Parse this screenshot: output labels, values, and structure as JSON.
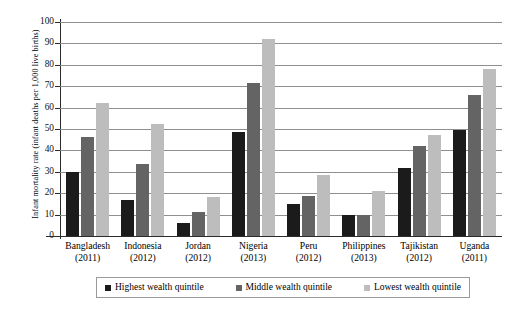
{
  "chart_data": {
    "type": "bar",
    "title": "",
    "subtitle": "",
    "xlabel": "",
    "ylabel": "Infant mortality rate (infant deaths per 1,000 live births)",
    "ylim": [
      0,
      100
    ],
    "ytick_values": [
      0,
      10,
      20,
      30,
      40,
      50,
      60,
      70,
      80,
      90,
      100
    ],
    "ytick_labels": [
      "0",
      "10",
      "20",
      "30",
      "40",
      "50",
      "60",
      "70",
      "80",
      "90",
      "100"
    ],
    "grid": true,
    "grid_axis": "y",
    "legend_position": "bottom",
    "categories": [
      "Bangladesh",
      "Indonesia",
      "Jordan",
      "Nigeria",
      "Peru",
      "Philippines",
      "Tajikistan",
      "Uganda"
    ],
    "category_years": [
      "(2011)",
      "(2012)",
      "(2012)",
      "(2013)",
      "(2012)",
      "(2013)",
      "(2012)",
      "(2011)"
    ],
    "series": [
      {
        "name": "Highest wealth quintile",
        "color": "#1b1b1b",
        "values": [
          30,
          17,
          6,
          48.5,
          15,
          10,
          32,
          49.5
        ]
      },
      {
        "name": "Middle wealth quintile",
        "color": "#646464",
        "values": [
          46.5,
          33.5,
          11,
          71.5,
          18.5,
          10,
          42,
          66
        ]
      },
      {
        "name": "Lowest wealth quintile",
        "color": "#bdbdbd",
        "values": [
          62,
          52.5,
          18,
          92,
          28.5,
          21,
          47,
          78
        ]
      }
    ]
  }
}
